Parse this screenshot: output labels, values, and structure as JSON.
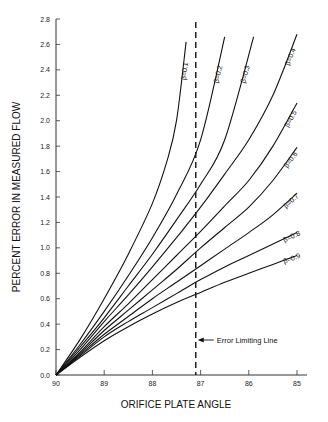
{
  "chart_data": {
    "type": "line",
    "title": "",
    "xlabel": "ORIFICE PLATE ANGLE",
    "ylabel": "PERCENT ERROR IN MEASURED FLOW",
    "xlim": [
      90,
      85
    ],
    "ylim": [
      0,
      2.8
    ],
    "x_ticks": [
      "90",
      "89",
      "88",
      "87",
      "86",
      "85"
    ],
    "y_ticks": [
      "0.0",
      "0.2",
      "0.4",
      "0.6",
      "0.8",
      "1.0",
      "1.2",
      "1.4",
      "1.6",
      "1.8",
      "2.0",
      "2.2",
      "2.4",
      "2.6",
      "2.8"
    ],
    "grid": false,
    "legend": "inline curve labels",
    "series": [
      {
        "name": "β=0.1",
        "x": [
          90,
          89.5,
          89,
          88.5,
          88,
          87.7,
          87.5,
          87.3
        ],
        "values": [
          0,
          0.28,
          0.6,
          0.95,
          1.35,
          1.68,
          2.0,
          2.62
        ]
      },
      {
        "name": "β=0.2",
        "x": [
          90,
          89.5,
          89,
          88.5,
          88,
          87.5,
          87,
          86.5
        ],
        "values": [
          0,
          0.24,
          0.5,
          0.78,
          1.08,
          1.42,
          1.85,
          2.66
        ]
      },
      {
        "name": "β=0.3",
        "x": [
          90,
          89.5,
          89,
          88.5,
          88,
          87.5,
          87,
          86.5,
          85.9
        ],
        "values": [
          0,
          0.22,
          0.45,
          0.7,
          0.95,
          1.22,
          1.5,
          1.85,
          2.66
        ]
      },
      {
        "name": "β=0.4",
        "x": [
          90,
          89.5,
          89,
          88.5,
          88,
          87.5,
          87,
          86.5,
          86,
          85.5,
          85
        ],
        "values": [
          0,
          0.2,
          0.42,
          0.63,
          0.85,
          1.08,
          1.32,
          1.58,
          1.85,
          2.2,
          2.68
        ]
      },
      {
        "name": "β=0.5",
        "x": [
          90,
          89.5,
          89,
          88.5,
          88,
          87.5,
          87,
          86.5,
          86,
          85.5,
          85
        ],
        "values": [
          0,
          0.18,
          0.38,
          0.56,
          0.75,
          0.94,
          1.13,
          1.33,
          1.53,
          1.8,
          2.14
        ]
      },
      {
        "name": "β=0.6",
        "x": [
          90,
          89.5,
          89,
          88.5,
          88,
          87.5,
          87,
          86.5,
          86,
          85.5,
          85
        ],
        "values": [
          0,
          0.17,
          0.35,
          0.51,
          0.67,
          0.83,
          1.0,
          1.16,
          1.32,
          1.53,
          1.79
        ]
      },
      {
        "name": "β=0.7",
        "x": [
          90,
          89.5,
          89,
          88.5,
          88,
          87.5,
          87,
          86.5,
          86,
          85.5,
          85
        ],
        "values": [
          0,
          0.16,
          0.32,
          0.46,
          0.6,
          0.73,
          0.86,
          0.99,
          1.12,
          1.26,
          1.43
        ]
      },
      {
        "name": "β=0.8",
        "x": [
          90,
          89.5,
          89,
          88.5,
          88,
          87.5,
          87,
          86.5,
          86,
          85.5,
          85
        ],
        "values": [
          0,
          0.15,
          0.3,
          0.42,
          0.53,
          0.64,
          0.75,
          0.85,
          0.94,
          1.03,
          1.12
        ]
      },
      {
        "name": "β=0.9",
        "x": [
          90,
          89.5,
          89,
          88.5,
          88,
          87.5,
          87,
          86.5,
          86,
          85.5,
          85
        ],
        "values": [
          0,
          0.14,
          0.27,
          0.38,
          0.48,
          0.57,
          0.65,
          0.73,
          0.8,
          0.87,
          0.94
        ]
      }
    ],
    "annotations": [
      {
        "text": "Error Limiting Line",
        "x": 87.1,
        "style": "dashed vertical line with left arrow"
      }
    ],
    "error_limiting_line_x": 87.1
  }
}
